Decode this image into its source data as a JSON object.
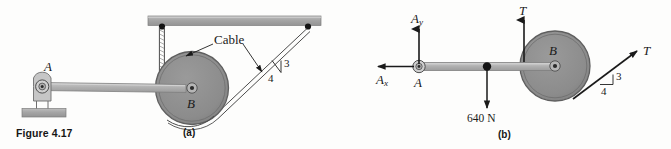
{
  "figure": {
    "caption": "Figure 4.17",
    "panel_a_label": "(a)",
    "panel_b_label": "(b)"
  },
  "colors": {
    "background": "#fdfdfc",
    "pulley_fill": "#8e8e8e",
    "pulley_edge": "#6f6f6f",
    "bar_fill": "#a8a8a8",
    "arm_fill": "#b4b4b4",
    "ink": "#1a1a1a",
    "cable": "#555555"
  },
  "panel_a": {
    "name": "(a)",
    "labels": {
      "pin_support": "A",
      "pulley": "B",
      "cable": "Cable",
      "slope_rise": "3",
      "slope_run": "4"
    }
  },
  "panel_b": {
    "name": "(b)",
    "labels": {
      "reaction_y": "A",
      "reaction_y_sub": "y",
      "reaction_x": "A",
      "reaction_x_sub": "x",
      "pin": "A",
      "pulley": "B",
      "tension_vertical": "T",
      "tension_inclined": "T",
      "weight": "640 N",
      "slope_rise": "3",
      "slope_run": "4"
    }
  }
}
